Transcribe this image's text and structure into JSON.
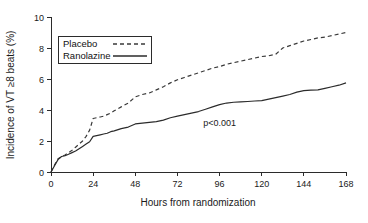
{
  "chart_data": {
    "type": "line",
    "title": "",
    "subtitle": "",
    "xlabel": "Hours from randomization",
    "ylabel": "Incidence of VT ≥8 beats (%)",
    "xlim": [
      0,
      168
    ],
    "ylim": [
      0,
      10
    ],
    "xticks": [
      0,
      24,
      48,
      72,
      96,
      120,
      144,
      168
    ],
    "xtick_labels": [
      "0",
      "24",
      "48",
      "72",
      "96",
      "120",
      "144",
      "168"
    ],
    "yticks": [
      0,
      2,
      4,
      6,
      8,
      10
    ],
    "ytick_labels": [
      "0",
      "2",
      "4",
      "6",
      "8",
      "10"
    ],
    "grid": false,
    "legend_position": "upper-left",
    "annotations": [
      {
        "text": "p<0.001",
        "x": 96,
        "y": 3.0
      }
    ],
    "series": [
      {
        "name": "Placebo",
        "style": "dashed",
        "color": "#3a3a3a",
        "x": [
          0,
          2,
          4,
          6,
          8,
          10,
          12,
          14,
          16,
          18,
          20,
          22,
          24,
          26,
          28,
          30,
          32,
          34,
          36,
          40,
          44,
          48,
          52,
          56,
          60,
          64,
          68,
          72,
          76,
          80,
          84,
          88,
          92,
          96,
          100,
          104,
          108,
          112,
          116,
          120,
          124,
          128,
          132,
          136,
          140,
          144,
          148,
          152,
          156,
          160,
          164,
          168
        ],
        "values": [
          0.0,
          0.45,
          0.85,
          1.0,
          1.1,
          1.25,
          1.4,
          1.6,
          1.8,
          2.0,
          2.3,
          2.7,
          3.45,
          3.5,
          3.55,
          3.6,
          3.7,
          3.8,
          3.95,
          4.2,
          4.45,
          4.85,
          5.0,
          5.1,
          5.3,
          5.5,
          5.75,
          5.95,
          6.1,
          6.25,
          6.4,
          6.55,
          6.7,
          6.8,
          6.95,
          7.05,
          7.15,
          7.25,
          7.35,
          7.45,
          7.5,
          7.6,
          8.0,
          8.15,
          8.3,
          8.45,
          8.55,
          8.65,
          8.7,
          8.8,
          8.9,
          9.0
        ]
      },
      {
        "name": "Ranolazine",
        "style": "solid",
        "color": "#2b2b2b",
        "x": [
          0,
          2,
          4,
          6,
          8,
          10,
          12,
          14,
          16,
          18,
          20,
          22,
          24,
          26,
          28,
          30,
          32,
          34,
          36,
          40,
          44,
          48,
          52,
          56,
          60,
          64,
          68,
          72,
          76,
          80,
          84,
          88,
          92,
          96,
          100,
          104,
          108,
          112,
          116,
          120,
          124,
          128,
          132,
          136,
          140,
          144,
          148,
          152,
          156,
          160,
          164,
          168
        ],
        "values": [
          0.0,
          0.4,
          0.8,
          1.0,
          1.05,
          1.15,
          1.25,
          1.35,
          1.5,
          1.65,
          1.8,
          1.95,
          2.3,
          2.35,
          2.4,
          2.45,
          2.5,
          2.6,
          2.65,
          2.8,
          2.9,
          3.1,
          3.15,
          3.2,
          3.25,
          3.35,
          3.5,
          3.6,
          3.7,
          3.8,
          3.9,
          4.05,
          4.2,
          4.35,
          4.45,
          4.5,
          4.52,
          4.55,
          4.58,
          4.6,
          4.7,
          4.8,
          4.9,
          5.0,
          5.15,
          5.25,
          5.28,
          5.3,
          5.4,
          5.5,
          5.6,
          5.75
        ]
      }
    ]
  },
  "legend": {
    "items": [
      {
        "label": "Placebo",
        "style": "dashed"
      },
      {
        "label": "Ranolazine",
        "style": "solid"
      }
    ]
  }
}
